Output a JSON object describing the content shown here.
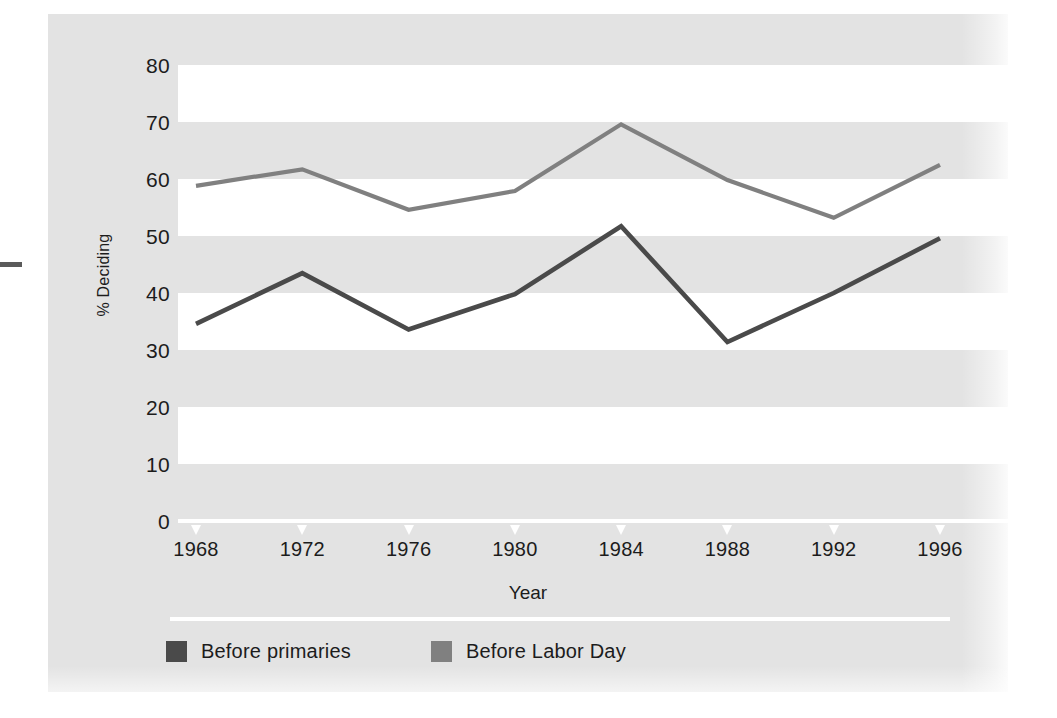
{
  "figure": {
    "ylabel": "% Deciding",
    "xlabel": "Year",
    "yticks": [
      "0",
      "10",
      "20",
      "30",
      "40",
      "50",
      "60",
      "70",
      "80"
    ],
    "xticks": [
      "1968",
      "1972",
      "1976",
      "1980",
      "1984",
      "1988",
      "1992",
      "1996"
    ],
    "legend": {
      "items": [
        {
          "label": "Before primaries",
          "color": "#4a4a4a"
        },
        {
          "label": "Before Labor Day",
          "color": "#808080"
        }
      ]
    },
    "colors": {
      "panel_background": "#e3e3e3",
      "band_white": "#ffffff",
      "axis_white": "#ffffff",
      "text": "#1c1c1c",
      "series_primaries": "#4a4a4a",
      "series_labor_day": "#808080"
    }
  },
  "chart_data": {
    "type": "line",
    "title": "",
    "xlabel": "Year",
    "ylabel": "% Deciding",
    "x": [
      1968,
      1972,
      1976,
      1980,
      1984,
      1988,
      1992,
      1996
    ],
    "categories": [
      "1968",
      "1972",
      "1976",
      "1980",
      "1984",
      "1988",
      "1992",
      "1996"
    ],
    "xlim": [
      1968,
      1996
    ],
    "ylim": [
      0,
      80
    ],
    "ytick_values": [
      0,
      10,
      20,
      30,
      40,
      50,
      60,
      70,
      80
    ],
    "ytick_interval": 10,
    "grid": "alternating horizontal bands (white over grey), 10-unit height",
    "legend_position": "below axis, left aligned",
    "series": [
      {
        "name": "Before primaries",
        "color": "#4a4a4a",
        "values": [
          34.6,
          43.5,
          33.6,
          39.8,
          51.7,
          31.4,
          40.0,
          49.6
        ]
      },
      {
        "name": "Before Labor Day",
        "color": "#808080",
        "values": [
          58.8,
          61.7,
          54.6,
          57.9,
          69.6,
          59.8,
          53.2,
          62.5
        ]
      }
    ]
  }
}
